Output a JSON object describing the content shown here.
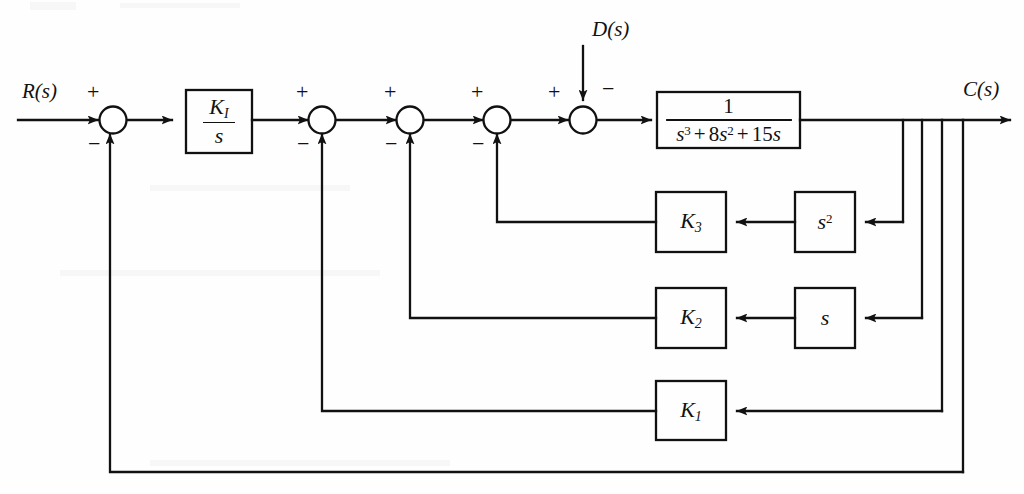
{
  "diagram": {
    "line_color": "#111111",
    "background": "#ffffff",
    "signals": {
      "input": "R(s)",
      "output": "C(s)",
      "disturbance": "D(s)"
    },
    "blocks": [
      {
        "id": "integral-gain",
        "num": "K",
        "num_sub": "I",
        "den": "s",
        "type": "fraction"
      },
      {
        "id": "plant",
        "num": "1",
        "den": "s3 + 8s2 + 15s",
        "type": "fraction"
      },
      {
        "id": "gain-k3",
        "label": "K",
        "sub": "3"
      },
      {
        "id": "gain-k2",
        "label": "K",
        "sub": "2"
      },
      {
        "id": "gain-k1",
        "label": "K",
        "sub": "1"
      },
      {
        "id": "deriv-s2",
        "label": "s",
        "sup": "2"
      },
      {
        "id": "deriv-s",
        "label": "s",
        "sup": ""
      }
    ],
    "plant_denominator": {
      "s_cubed": "s",
      "s_cubed_exp": "3",
      "plus1": "+",
      "coef2": "8",
      "s_squared": "s",
      "s_squared_exp": "2",
      "plus2": "+",
      "coef1": "15",
      "s_linear": "s"
    },
    "summing_junctions": [
      {
        "id": "sum-1",
        "plus": "+",
        "minus": "−",
        "note": "R(s) plus, outer feedback minus"
      },
      {
        "id": "sum-2",
        "plus": "+",
        "minus": "−",
        "note": "K1 feedback minus"
      },
      {
        "id": "sum-3",
        "plus": "+",
        "minus": "−",
        "note": "K2 feedback minus"
      },
      {
        "id": "sum-4",
        "plus": "+",
        "minus": "−",
        "note": "K3 feedback minus"
      },
      {
        "id": "sum-5",
        "plus": "+",
        "minus": "−",
        "note": "D(s) disturbance minus"
      }
    ],
    "signs": {
      "plus": "+",
      "minus": "−"
    }
  }
}
